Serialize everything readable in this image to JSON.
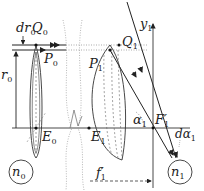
{
  "figure": {
    "type": "optics-diagram",
    "labels": {
      "dr0": {
        "main": "dr",
        "sub": "0"
      },
      "Q0": {
        "main": "Q",
        "sub": "0"
      },
      "P0": {
        "main": "P",
        "sub": "0"
      },
      "r0": {
        "main": "r",
        "sub": "0"
      },
      "E0": {
        "main": "E",
        "sub": "0"
      },
      "P1": {
        "main": "P",
        "sub": "1"
      },
      "Q1": {
        "main": "Q",
        "sub": "1"
      },
      "y1": {
        "main": "y",
        "sub": "1"
      },
      "alpha1": {
        "main": "α",
        "sub": "1"
      },
      "F1prime": {
        "main": "F",
        "sub": "1",
        "prime": "′"
      },
      "E1": {
        "main": "E",
        "sub": "1"
      },
      "dalpha1": {
        "main": "dα",
        "sub": "1"
      },
      "f1prime": {
        "main": "f",
        "sub": "1",
        "prime": "′"
      },
      "n0": {
        "main": "n",
        "sub": "0"
      },
      "n1": {
        "main": "n",
        "sub": "1"
      }
    },
    "colors": {
      "line": "#333333",
      "dotted": "#999999",
      "background": "#ffffff"
    }
  }
}
